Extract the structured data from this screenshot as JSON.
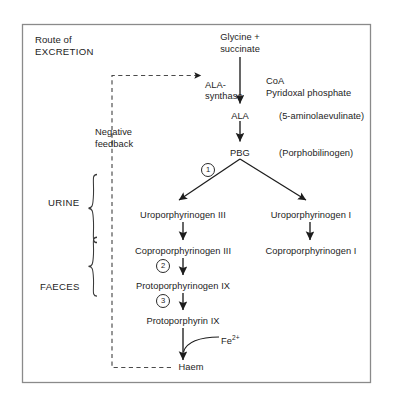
{
  "figure": {
    "title_line1": "Route of",
    "title_line2": "EXCRETION",
    "border_color": "#8a8a8a",
    "line_color": "#1d1d1d",
    "background": "#ffffff"
  },
  "pathway": {
    "substrate_line1": "Glycine +",
    "substrate_line2": "succinate",
    "enzyme_line1": "ALA-",
    "enzyme_line2": "synthase",
    "cofactor_line1": "CoA",
    "cofactor_line2": "Pyridoxal  phosphate",
    "ala": "ALA",
    "ala_full": "(5-aminolaevulinate)",
    "pbg": "PBG",
    "pbg_full": "(Porphobilinogen)",
    "uro_iii": "Uroporphyrinogen III",
    "uro_i": "Uroporphyrinogen I",
    "copro_iii": "Coproporphyrinogen III",
    "copro_i": "Coproporphyrinogen I",
    "protogen_ix": "Protoporphyrinogen IX",
    "proto_ix": "Protoporphyrin IX",
    "iron": "Fe",
    "iron_charge": "2+",
    "haem": "Haem"
  },
  "feedback": {
    "label_line1": "Negative",
    "label_line2": "feedback"
  },
  "excretion": {
    "urine": "URINE",
    "faeces": "FAECES"
  },
  "steps": [
    {
      "id": "1",
      "label": "①",
      "num": "1"
    },
    {
      "id": "2",
      "label": "②",
      "num": "2"
    },
    {
      "id": "3",
      "label": "③",
      "num": "3"
    }
  ]
}
